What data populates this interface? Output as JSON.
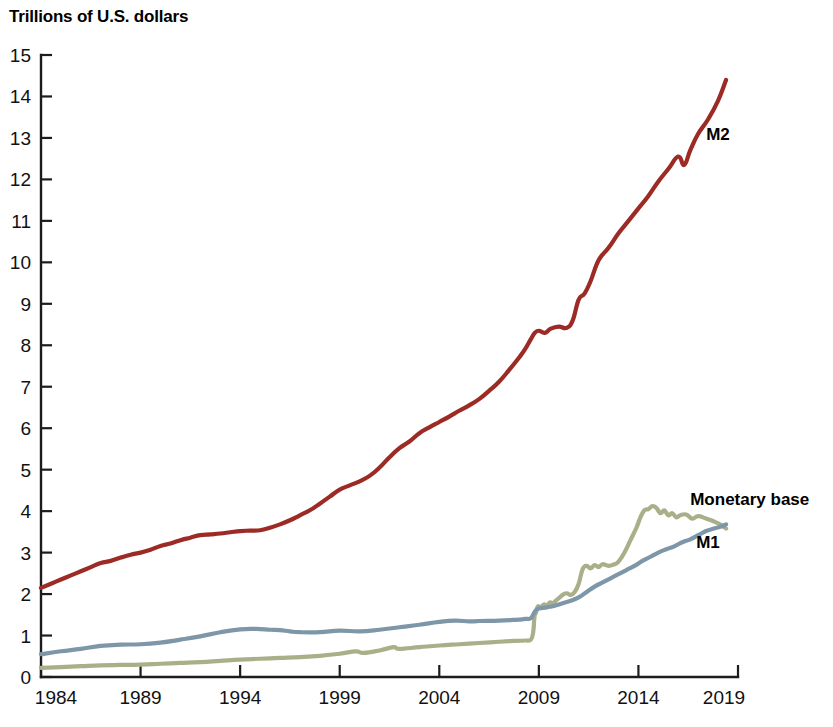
{
  "chart_data": {
    "type": "line",
    "title": "Trillions of U.S. dollars",
    "xlabel": "",
    "ylabel": "Trillions of U.S. dollars",
    "xlim": [
      1984,
      2019
    ],
    "ylim": [
      0,
      15
    ],
    "grid": false,
    "legend": "inline-labels-right",
    "y_ticks": [
      "15",
      "14",
      "13",
      "12",
      "11",
      "10",
      "9",
      "8",
      "7",
      "6",
      "5",
      "4",
      "3",
      "2",
      "1",
      "0"
    ],
    "x_ticks": [
      "1984",
      "1989",
      "1994",
      "1999",
      "2004",
      "2009",
      "2014",
      "2019"
    ],
    "colors": {
      "m2": "#9c2a25",
      "m1": "#7d97a8",
      "monetary_base": "#a9b089",
      "axis": "#1c1c1c",
      "background": "#ffffff"
    },
    "series": [
      {
        "name": "M2",
        "label": "M2",
        "color": "#9c2a25",
        "label_x": 2017.4,
        "label_y": 12.95,
        "x": [
          1984.0,
          1984.5,
          1985.0,
          1985.5,
          1986.0,
          1986.5,
          1987.0,
          1987.5,
          1988.0,
          1988.5,
          1989.0,
          1989.5,
          1990.0,
          1990.5,
          1991.0,
          1991.5,
          1992.0,
          1992.5,
          1993.0,
          1993.5,
          1994.0,
          1994.5,
          1995.0,
          1995.5,
          1996.0,
          1996.5,
          1997.0,
          1997.5,
          1998.0,
          1998.5,
          1999.0,
          1999.5,
          2000.0,
          2000.5,
          2001.0,
          2001.5,
          2002.0,
          2002.5,
          2003.0,
          2003.5,
          2004.0,
          2004.5,
          2005.0,
          2005.5,
          2006.0,
          2006.5,
          2007.0,
          2007.5,
          2008.0,
          2008.3,
          2008.6,
          2008.8,
          2009.0,
          2009.3,
          2009.6,
          2010.0,
          2010.4,
          2010.7,
          2011.0,
          2011.3,
          2011.6,
          2012.0,
          2012.5,
          2013.0,
          2013.5,
          2014.0,
          2014.5,
          2015.0,
          2015.5,
          2016.0,
          2016.3,
          2016.6,
          2017.0,
          2017.5,
          2018.0,
          2018.4
        ],
        "values": [
          2.15,
          2.25,
          2.35,
          2.45,
          2.55,
          2.65,
          2.75,
          2.8,
          2.88,
          2.95,
          3.0,
          3.07,
          3.16,
          3.22,
          3.3,
          3.36,
          3.42,
          3.44,
          3.46,
          3.49,
          3.52,
          3.53,
          3.54,
          3.6,
          3.68,
          3.78,
          3.9,
          4.02,
          4.18,
          4.35,
          4.52,
          4.62,
          4.72,
          4.85,
          5.05,
          5.3,
          5.52,
          5.68,
          5.88,
          6.02,
          6.15,
          6.28,
          6.42,
          6.55,
          6.7,
          6.9,
          7.12,
          7.4,
          7.7,
          7.9,
          8.15,
          8.3,
          8.35,
          8.3,
          8.4,
          8.45,
          8.42,
          8.6,
          9.1,
          9.25,
          9.55,
          10.05,
          10.35,
          10.7,
          11.0,
          11.3,
          11.6,
          11.95,
          12.25,
          12.55,
          12.35,
          12.7,
          13.1,
          13.45,
          13.9,
          14.4
        ]
      },
      {
        "name": "Monetary base",
        "label": "Monetary base",
        "color": "#a9b089",
        "label_x": 2016.6,
        "label_y": 4.15,
        "x": [
          1984.0,
          1985.0,
          1986.0,
          1987.0,
          1988.0,
          1989.0,
          1990.0,
          1991.0,
          1992.0,
          1993.0,
          1994.0,
          1995.0,
          1996.0,
          1997.0,
          1998.0,
          1999.0,
          1999.8,
          2000.2,
          2001.0,
          2001.7,
          2002.0,
          2003.0,
          2004.0,
          2005.0,
          2006.0,
          2007.0,
          2007.8,
          2008.3,
          2008.6,
          2008.72,
          2008.78,
          2008.85,
          2008.95,
          2009.1,
          2009.25,
          2009.4,
          2009.55,
          2009.7,
          2009.85,
          2010.0,
          2010.2,
          2010.4,
          2010.6,
          2010.8,
          2011.0,
          2011.2,
          2011.4,
          2011.6,
          2011.8,
          2012.0,
          2012.2,
          2012.5,
          2012.8,
          2013.0,
          2013.3,
          2013.6,
          2013.9,
          2014.1,
          2014.3,
          2014.5,
          2014.7,
          2014.9,
          2015.1,
          2015.3,
          2015.5,
          2015.7,
          2015.9,
          2016.1,
          2016.4,
          2016.7,
          2017.0,
          2017.4,
          2017.8,
          2018.1,
          2018.4
        ],
        "values": [
          0.22,
          0.24,
          0.26,
          0.28,
          0.29,
          0.3,
          0.32,
          0.34,
          0.36,
          0.39,
          0.42,
          0.44,
          0.46,
          0.48,
          0.51,
          0.56,
          0.62,
          0.58,
          0.64,
          0.72,
          0.68,
          0.72,
          0.76,
          0.79,
          0.82,
          0.85,
          0.87,
          0.88,
          0.9,
          1.1,
          1.45,
          1.55,
          1.7,
          1.68,
          1.75,
          1.72,
          1.8,
          1.78,
          1.84,
          1.9,
          1.98,
          2.02,
          1.98,
          2.05,
          2.25,
          2.6,
          2.68,
          2.62,
          2.7,
          2.65,
          2.72,
          2.68,
          2.72,
          2.78,
          3.0,
          3.3,
          3.6,
          3.85,
          4.02,
          4.05,
          4.12,
          4.08,
          3.95,
          4.02,
          3.9,
          3.95,
          3.85,
          3.9,
          3.92,
          3.82,
          3.88,
          3.82,
          3.75,
          3.68,
          3.58
        ]
      },
      {
        "name": "M1",
        "label": "M1",
        "color": "#7d97a8",
        "label_x": 2016.9,
        "label_y": 3.12,
        "x": [
          1984.0,
          1985.0,
          1986.0,
          1987.0,
          1988.0,
          1989.0,
          1990.0,
          1991.0,
          1992.0,
          1993.0,
          1994.0,
          1994.8,
          1995.5,
          1996.0,
          1996.5,
          1997.0,
          1998.0,
          1999.0,
          2000.0,
          2001.0,
          2002.0,
          2003.0,
          2004.0,
          2004.8,
          2005.5,
          2006.0,
          2007.0,
          2007.8,
          2008.3,
          2008.6,
          2008.8,
          2009.0,
          2009.4,
          2009.8,
          2010.2,
          2010.6,
          2011.0,
          2011.4,
          2011.8,
          2012.2,
          2012.6,
          2013.0,
          2013.4,
          2013.8,
          2014.2,
          2014.6,
          2015.0,
          2015.4,
          2015.8,
          2016.2,
          2016.6,
          2017.0,
          2017.4,
          2017.8,
          2018.1,
          2018.4
        ],
        "values": [
          0.55,
          0.62,
          0.68,
          0.75,
          0.78,
          0.79,
          0.83,
          0.9,
          0.98,
          1.08,
          1.15,
          1.16,
          1.14,
          1.13,
          1.1,
          1.08,
          1.08,
          1.12,
          1.1,
          1.14,
          1.2,
          1.26,
          1.33,
          1.36,
          1.34,
          1.35,
          1.36,
          1.38,
          1.4,
          1.42,
          1.58,
          1.65,
          1.68,
          1.72,
          1.78,
          1.84,
          1.92,
          2.05,
          2.18,
          2.28,
          2.38,
          2.48,
          2.58,
          2.68,
          2.8,
          2.9,
          3.0,
          3.08,
          3.15,
          3.25,
          3.32,
          3.42,
          3.52,
          3.58,
          3.62,
          3.68
        ]
      }
    ]
  }
}
